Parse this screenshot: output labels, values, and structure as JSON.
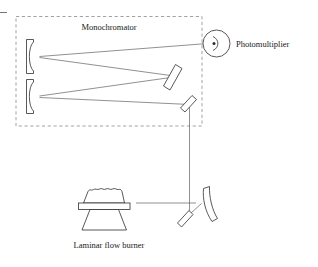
{
  "figure": {
    "title_internal": "Atomic absorption / flame emission optical layout",
    "background_color": "#ffffff",
    "width": 318,
    "height": 267
  },
  "labels": {
    "monochromator": "Monochromator",
    "photomultiplier": "Photomultiplier",
    "burner": "Laminar flow burner"
  },
  "colors": {
    "line": "#2e2e2e",
    "beam": "#555555",
    "dashed_border": "#8a8a8a",
    "text": "#1a1a1a",
    "background": "#ffffff"
  },
  "components": [
    {
      "id": "monochromator-enclosure",
      "type": "dashed-rectangle",
      "label": "Monochromator"
    },
    {
      "id": "collimating-mirror-upper",
      "type": "concave-mirror",
      "label": ""
    },
    {
      "id": "collimating-mirror-lower",
      "type": "concave-mirror",
      "label": ""
    },
    {
      "id": "grating-mirror",
      "type": "flat-tilted-mirror",
      "label": ""
    },
    {
      "id": "entrance-mirror",
      "type": "flat-tilted-mirror",
      "label": ""
    },
    {
      "id": "photomultiplier-tube",
      "type": "detector-circle",
      "label": "Photomultiplier"
    },
    {
      "id": "focusing-mirror-concave",
      "type": "concave-mirror",
      "label": ""
    },
    {
      "id": "turning-mirror-flat",
      "type": "flat-tilted-mirror",
      "label": ""
    },
    {
      "id": "laminar-flow-burner",
      "type": "burner",
      "label": "Laminar flow burner"
    }
  ],
  "beam_paths": [
    {
      "id": "burner-to-turning-mirror",
      "from": "laminar-flow-burner",
      "to": "turning-mirror-flat"
    },
    {
      "id": "turning-mirror-to-focusing-mirror",
      "from": "turning-mirror-flat",
      "to": "focusing-mirror-concave"
    },
    {
      "id": "focusing-mirror-to-entrance-mirror",
      "from": "focusing-mirror-concave",
      "to": "entrance-mirror"
    },
    {
      "id": "entrance-mirror-to-lower-collimator",
      "from": "entrance-mirror",
      "to": "collimating-mirror-lower"
    },
    {
      "id": "lower-collimator-to-grating",
      "from": "collimating-mirror-lower",
      "to": "grating-mirror"
    },
    {
      "id": "grating-to-upper-collimator",
      "from": "grating-mirror",
      "to": "collimating-mirror-upper"
    },
    {
      "id": "upper-collimator-to-photomultiplier",
      "from": "collimating-mirror-upper",
      "to": "photomultiplier-tube"
    }
  ]
}
